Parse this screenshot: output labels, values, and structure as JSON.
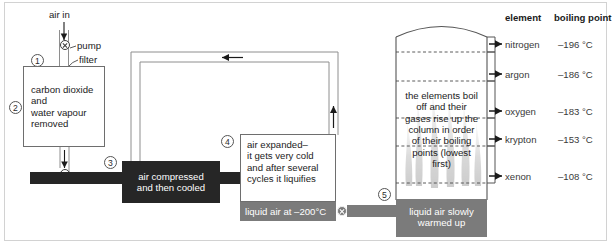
{
  "diagram": {
    "title_alt": "Fractional distillation of liquid air",
    "inlet": {
      "air_in": "air in",
      "pump": "pump",
      "filter": "filter"
    },
    "steps": {
      "s1": "1",
      "s2": "2",
      "s3": "3",
      "s4": "4",
      "s5": "5"
    },
    "stage1_box": "carbon dioxide\nand\nwater vapour\nremoved",
    "stage3_bar": "air compressed\nand then cooled",
    "stage4_box": "air expanded–\nit gets very cold\nand after several\ncycles it liquifies",
    "liquid_air_bar": "liquid air at –200°C",
    "warmed_bar": "liquid air slowly\nwarmed up",
    "column_note": "the elements boil\noff and their\ngases rise up the\ncolumn in order\nof their boiling\npoints (lowest\nfirst)"
  },
  "table": {
    "headers": {
      "element": "element",
      "boiling_point": "boiling point"
    },
    "rows": [
      {
        "element": "nitrogen",
        "boiling_point": "–196 °C"
      },
      {
        "element": "argon",
        "boiling_point": "–186 °C"
      },
      {
        "element": "oxygen",
        "boiling_point": "–183 °C"
      },
      {
        "element": "krypton",
        "boiling_point": "–153 °C"
      },
      {
        "element": "xenon",
        "boiling_point": "–108 °C"
      }
    ]
  },
  "colors": {
    "dark_bar": "#262626",
    "mid_bar": "#7b7b7b",
    "outline": "#6e6e6e",
    "frame": "#d2d2d2",
    "plume": "#bdbdbd"
  }
}
